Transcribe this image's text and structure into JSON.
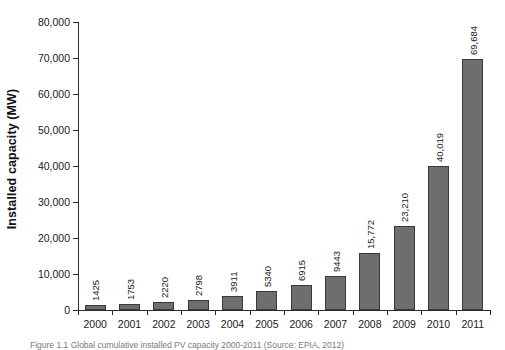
{
  "chart_data": {
    "type": "bar",
    "title": "",
    "xlabel": "",
    "ylabel": "Installed capacity (MW)",
    "categories": [
      "2000",
      "2001",
      "2002",
      "2003",
      "2004",
      "2005",
      "2006",
      "2007",
      "2008",
      "2009",
      "2010",
      "2011"
    ],
    "values": [
      1425,
      1753,
      2220,
      2798,
      3911,
      5340,
      6915,
      9443,
      15772,
      23210,
      40019,
      69684
    ],
    "value_labels": [
      "1425",
      "1753",
      "2220",
      "2798",
      "3911",
      "5340",
      "6915",
      "9443",
      "15,772",
      "23,210",
      "40,019",
      "69,684"
    ],
    "ylim": [
      0,
      80000
    ],
    "ytick_values": [
      0,
      10000,
      20000,
      30000,
      40000,
      50000,
      60000,
      70000,
      80000
    ],
    "ytick_labels": [
      "0",
      "10,000",
      "20,000",
      "30,000",
      "40,000",
      "50,000",
      "60,000",
      "70,000",
      "80,000"
    ],
    "grid": false,
    "legend": null,
    "legend_position": "none",
    "series_color": "#6e6e6e",
    "axis_color": "#2b2b2b"
  },
  "caption": {
    "text": "Figure 1.1  Global cumulative installed PV capacity 2000-2011 (Source: EPIA, 2012)"
  }
}
